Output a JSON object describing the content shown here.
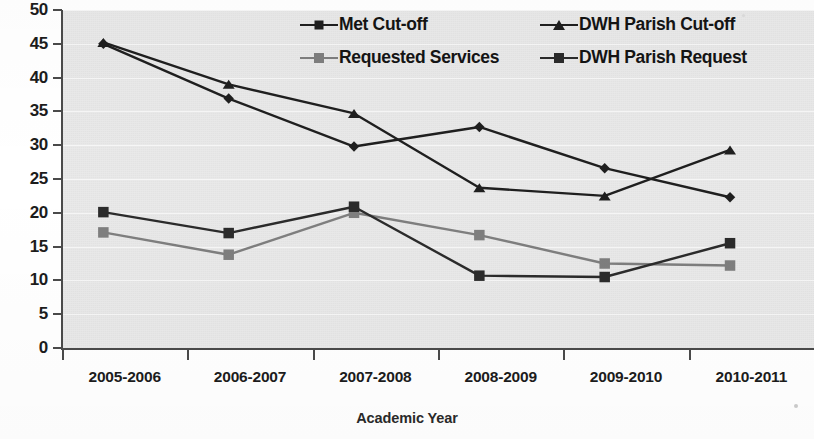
{
  "chart_data": {
    "type": "line",
    "title": "",
    "xlabel": "Academic Year",
    "ylabel": "",
    "categories": [
      "2005-2006",
      "2006-2007",
      "2007-2008",
      "2008-2009",
      "2009-2010",
      "2010-2011"
    ],
    "ylim": [
      0,
      50
    ],
    "ytick_step": 5,
    "yticks": [
      0,
      5,
      10,
      15,
      20,
      25,
      30,
      35,
      40,
      45,
      50
    ],
    "ytick_labels": [
      "0",
      "5",
      "10",
      "15",
      "20",
      "25",
      "30",
      "35",
      "40",
      "45",
      "50"
    ],
    "grid": true,
    "grid_axis": "y",
    "legend_position": "top-right-inside",
    "plot_background": "#e9e9e9",
    "series": [
      {
        "name": "Met Cut-off",
        "marker": "diamond",
        "color": "#1f1f1f",
        "values": [
          45.0,
          36.9,
          29.8,
          32.7,
          26.6,
          22.3
        ]
      },
      {
        "name": "DWH Parish Cut-off",
        "marker": "triangle",
        "color": "#1f1f1f",
        "values": [
          45.2,
          39.0,
          34.7,
          23.7,
          22.5,
          29.3
        ]
      },
      {
        "name": "Requested Services",
        "marker": "square",
        "color": "#7e7e7e",
        "values": [
          17.1,
          13.8,
          20.0,
          16.7,
          12.5,
          12.2
        ]
      },
      {
        "name": "DWH Parish Request",
        "marker": "square",
        "color": "#2b2b2b",
        "values": [
          20.1,
          17.0,
          20.9,
          10.7,
          10.5,
          15.5
        ]
      }
    ]
  },
  "legend": {
    "entries": [
      {
        "label": "Met Cut-off",
        "marker": "diamond",
        "color": "#1f1f1f"
      },
      {
        "label": "DWH Parish Cut-off",
        "marker": "triangle",
        "color": "#1f1f1f"
      },
      {
        "label": "Requested Services",
        "marker": "square-gray",
        "color": "#7e7e7e"
      },
      {
        "label": "DWH Parish Request",
        "marker": "square-dark",
        "color": "#2b2b2b"
      }
    ]
  },
  "axes": {
    "x_title": "Academic Year"
  }
}
